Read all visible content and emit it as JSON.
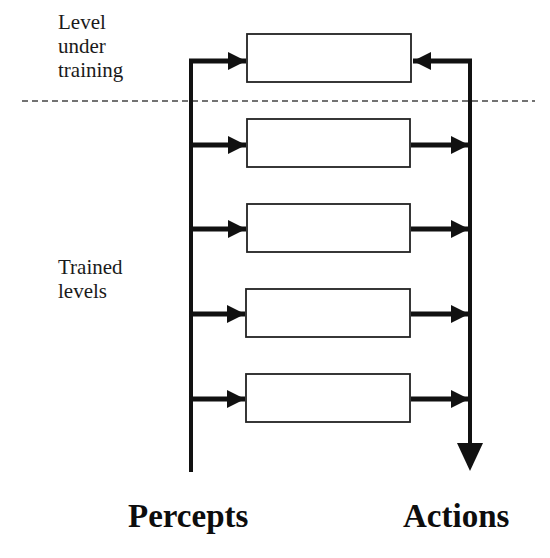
{
  "labels": {
    "level_under_training": [
      "Level",
      "under",
      "training"
    ],
    "trained_levels": [
      "Trained",
      "levels"
    ],
    "percepts": "Percepts",
    "actions": "Actions"
  },
  "diagram": {
    "boxes": [
      {
        "id": "level-under-training",
        "role": "under-training",
        "arrow_in_from": "actions"
      },
      {
        "id": "trained-level-1",
        "role": "trained",
        "arrow_in_from": "percepts",
        "arrow_out_to": "actions"
      },
      {
        "id": "trained-level-2",
        "role": "trained",
        "arrow_in_from": "percepts",
        "arrow_out_to": "actions"
      },
      {
        "id": "trained-level-3",
        "role": "trained",
        "arrow_in_from": "percepts",
        "arrow_out_to": "actions"
      },
      {
        "id": "trained-level-4",
        "role": "trained",
        "arrow_in_from": "percepts",
        "arrow_out_to": "actions"
      }
    ],
    "separator": "dashed",
    "colors": {
      "line": "#111111",
      "box_border": "#222222",
      "box_fill": "#ffffff",
      "dashed": "#444444"
    }
  }
}
